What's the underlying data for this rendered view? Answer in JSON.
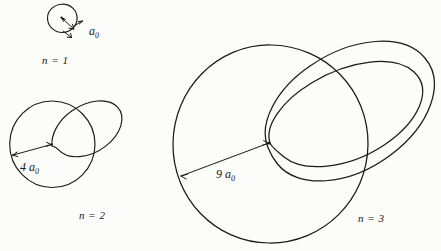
{
  "figure": {
    "style": "hand-drawn line diagram, black ink on white paper",
    "background_color": "#fcfcfa",
    "ink_color": "#1a1a1a"
  },
  "shells": [
    {
      "id": "n1",
      "label": "n = 1",
      "radius_label": "a",
      "radius_subscript": "0",
      "radius_label_full": "a₀",
      "orbit_count": 1,
      "orbits": [
        "circle"
      ]
    },
    {
      "id": "n2",
      "label": "n = 2",
      "radius_label": "4 a",
      "radius_subscript": "0",
      "radius_label_full": "4 a₀",
      "orbit_count": 2,
      "orbits": [
        "circle",
        "ellipse"
      ]
    },
    {
      "id": "n3",
      "label": "n = 3",
      "radius_label": "9 a",
      "radius_subscript": "0",
      "radius_label_full": "9 a₀",
      "orbit_count": 3,
      "orbits": [
        "circle",
        "ellipse-wide",
        "ellipse-narrow"
      ]
    }
  ],
  "diagram_data": {
    "type": "diagram",
    "subject": "atomic electron shells",
    "note": "Each shell n shows one circular orbit plus n-1 elliptical orbits sharing a common focus at the nucleus; circle radius scales as n squared times a₀."
  }
}
